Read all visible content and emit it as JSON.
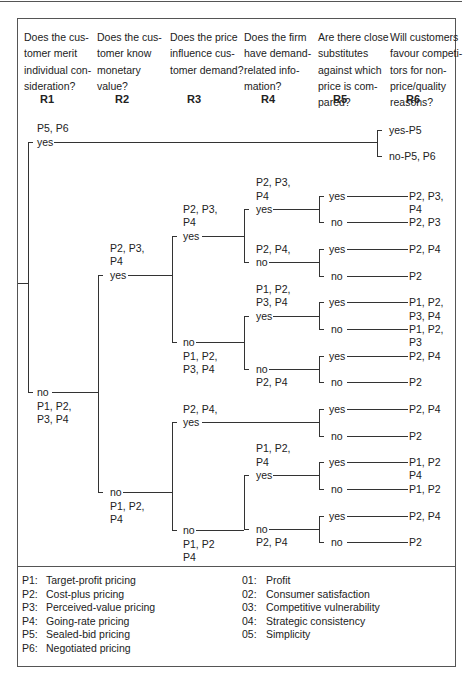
{
  "questions": [
    {
      "id": "R1",
      "text": "Does the customer merit individual consideration?",
      "lines": [
        "Does the cus-",
        "tomer merit",
        "individual con-",
        "sideration?"
      ]
    },
    {
      "id": "R2",
      "text": "Does the customer know monetary value?",
      "lines": [
        "Does the cus-",
        "tomer know",
        "monetary",
        "value?"
      ]
    },
    {
      "id": "R3",
      "text": "Does the price influence customer demand?",
      "lines": [
        "Does the price",
        "influence cus-",
        "tomer demand?"
      ]
    },
    {
      "id": "R4",
      "text": "Does the firm have demand-related information?",
      "lines": [
        "Does the firm",
        "have demand-",
        "related info-",
        "mation?"
      ]
    },
    {
      "id": "R5",
      "text": "Are there close substitutes against which price is compared?",
      "lines": [
        "Are there close",
        "substitutes",
        "against which",
        "price is com-",
        "pared?"
      ]
    },
    {
      "id": "R6",
      "text": "Will customers favour competitors for non-price/quality reasons?",
      "lines": [
        "Will customers",
        "favour competi-",
        "tors for non-",
        "price/quality",
        "reasons?"
      ]
    }
  ],
  "tree": {
    "r1_yes": {
      "label": "yes",
      "set": "P5, P6"
    },
    "r6_yes": "yes-P5",
    "r6_no": "no-P5, P6",
    "r1_no": {
      "label": "no",
      "set1": "P1, P2,",
      "set2": "P3, P4"
    },
    "r2_yes": {
      "label": "yes",
      "set1": "P2, P3,",
      "set2": "P4"
    },
    "r2_no": {
      "label": "no",
      "set1": "P1, P2,",
      "set2": "P4"
    },
    "a_r3_yes": {
      "label": "yes",
      "set1": "P2, P3,",
      "set2": "P4"
    },
    "a_r3_no": {
      "label": "no",
      "set1": "P1, P2,",
      "set2": "P3, P4"
    },
    "b_r3_yes": {
      "label": "yes",
      "set1": "P2, P4,"
    },
    "b_r3_no": {
      "label": "no",
      "set1": "P1, P2",
      "set2": "P4"
    },
    "a_r4_yes": {
      "label": "yes",
      "set1": "P2, P3,",
      "set2": "P4"
    },
    "a_r4_no": {
      "label": "no",
      "set1": "P2, P4,"
    },
    "b_r4_yes": {
      "label": "yes",
      "set1": "P1, P2,",
      "set2": "P3, P4"
    },
    "b_r4_no": {
      "label": "no",
      "set1": "P2, P4"
    },
    "c_r4_yes": {
      "label": "yes",
      "set1": "P1, P2,",
      "set2": "P4"
    },
    "c_r4_no": {
      "label": "no",
      "set1": "P2, P4"
    },
    "leaves": [
      {
        "r5": "yes",
        "result1": "P2, P3,",
        "result2": "P4"
      },
      {
        "r5": "no",
        "result1": "P2, P3"
      },
      {
        "r5": "yes",
        "result1": "P2, P4"
      },
      {
        "r5": "no",
        "result1": "P2"
      },
      {
        "r5": "yes",
        "result1": "P1, P2,",
        "result2": "P3, P4"
      },
      {
        "r5": "no",
        "result1": "P1, P2,",
        "result2": "P3"
      },
      {
        "r5": "yes",
        "result1": "P2, P4"
      },
      {
        "r5": "no",
        "result1": "P2"
      },
      {
        "r5": "yes",
        "result1": "P2, P4"
      },
      {
        "r5": "no",
        "result1": "P2"
      },
      {
        "r5": "yes",
        "result1": "P1, P2",
        "result2": "P4"
      },
      {
        "r5": "no",
        "result1": "P1, P2"
      },
      {
        "r5": "yes",
        "result1": "P2, P4"
      },
      {
        "r5": "no",
        "result1": "P2"
      }
    ]
  },
  "legend_pricing": [
    {
      "key": "P1:",
      "label": "Target-profit pricing"
    },
    {
      "key": "P2:",
      "label": "Cost-plus pricing"
    },
    {
      "key": "P3:",
      "label": "Perceived-value pricing"
    },
    {
      "key": "P4:",
      "label": "Going-rate pricing"
    },
    {
      "key": "P5:",
      "label": "Sealed-bid pricing"
    },
    {
      "key": "P6:",
      "label": "Negotiated pricing"
    }
  ],
  "legend_objectives": [
    {
      "key": "01:",
      "label": "Profit"
    },
    {
      "key": "02:",
      "label": "Consumer satisfaction"
    },
    {
      "key": "03:",
      "label": "Competitive vulnerability"
    },
    {
      "key": "04:",
      "label": "Strategic consistency"
    },
    {
      "key": "05:",
      "label": "Simplicity"
    }
  ]
}
